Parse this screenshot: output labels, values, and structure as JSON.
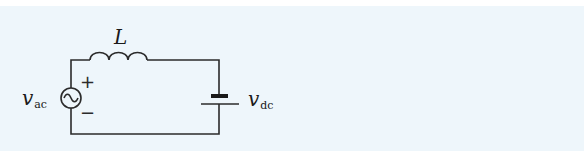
{
  "diagram": {
    "type": "circuit",
    "background": "#eef6fb",
    "line_color": "#2b2b2b",
    "components": {
      "ac_source": {
        "symbol": "v",
        "subscript": "ac",
        "plus": "+",
        "minus": "−"
      },
      "inductor": {
        "label": "L"
      },
      "dc_source": {
        "symbol": "v",
        "subscript": "dc"
      }
    }
  }
}
